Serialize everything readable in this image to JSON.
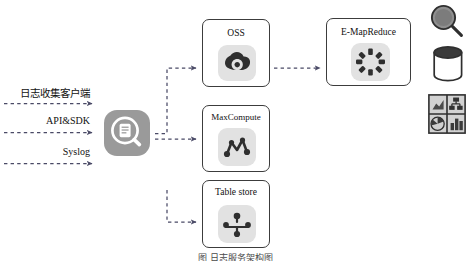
{
  "diagram": {
    "caption": "图 日志服务架构图",
    "colors": {
      "background": "#ffffff",
      "box_border": "#3c3c3c",
      "icon_plate": "#e2e2e2",
      "service_icon": "#9a9a9a",
      "connector": "#585878",
      "text": "#111111"
    },
    "sources": [
      {
        "label": "日志收集客户端",
        "icon": "dashed-arrow-icon"
      },
      {
        "label": "API&SDK",
        "icon": "dashed-arrow-icon"
      },
      {
        "label": "Syslog",
        "icon": "dashed-arrow-icon"
      }
    ],
    "hub": {
      "name": "log-service",
      "icon": "magnifier-document-icon"
    },
    "storage_nodes": [
      {
        "id": "oss",
        "label": "OSS",
        "icon": "cloud-icon"
      },
      {
        "id": "maxcompute",
        "label": "MaxCompute",
        "icon": "node-graph-icon"
      },
      {
        "id": "tablestore",
        "label": "Table store",
        "icon": "tree-hierarchy-icon"
      }
    ],
    "compute_nodes": [
      {
        "id": "emr",
        "label": "E-MapReduce",
        "icon": "cluster-ring-icon"
      }
    ],
    "side_icons": [
      {
        "id": "search",
        "icon": "magnifying-glass-icon",
        "label": "Search"
      },
      {
        "id": "storage",
        "icon": "database-cylinder-icon",
        "label": "Storage"
      },
      {
        "id": "analytics",
        "icon": "dashboard-charts-icon",
        "label": "Analytics"
      }
    ],
    "connections": [
      {
        "from": "日志收集客户端",
        "to": "log-service",
        "style": "dashed"
      },
      {
        "from": "API&SDK",
        "to": "log-service",
        "style": "dashed"
      },
      {
        "from": "Syslog",
        "to": "log-service",
        "style": "dashed"
      },
      {
        "from": "log-service",
        "to": "OSS",
        "style": "dashed"
      },
      {
        "from": "log-service",
        "to": "MaxCompute",
        "style": "dashed"
      },
      {
        "from": "log-service",
        "to": "Table store",
        "style": "dashed"
      },
      {
        "from": "OSS",
        "to": "E-MapReduce",
        "style": "dashed"
      }
    ]
  }
}
